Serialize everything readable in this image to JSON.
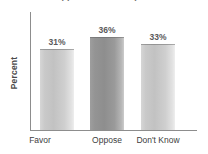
{
  "chart_data": {
    "type": "bar",
    "title": "Support for the Proposal",
    "categories": [
      "Favor",
      "Oppose",
      "Don't Know"
    ],
    "values": [
      31,
      36,
      33
    ],
    "value_labels": [
      "31%",
      "36%",
      "33%"
    ],
    "xlabel": "",
    "ylabel": "Percent",
    "ylim": [
      0,
      46
    ],
    "grid": false,
    "legend": false,
    "series": [
      {
        "name": "Percent",
        "values": [
          31,
          36,
          33
        ]
      }
    ],
    "bar_styles": [
      "light",
      "dark",
      "light"
    ],
    "colors": {
      "bar_light": "#c9c9c9",
      "bar_dark": "#949494",
      "axis": "#8d8d8d",
      "label_text": "#5a5a5a",
      "category_text": "#3d3d3d",
      "background": "#ffffff"
    }
  }
}
